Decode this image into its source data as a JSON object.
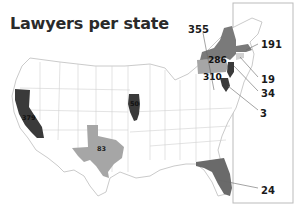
{
  "title": "Lawyers per state",
  "states": [
    {
      "name": "California",
      "value": "379",
      "shade": "#3a3a3a",
      "label_color": "#111111"
    },
    {
      "name": "Illinois",
      "value": "50",
      "shade": "#3a3a3a",
      "label_color": "#111111"
    },
    {
      "name": "Texas",
      "value": "83",
      "shade": "#a6a6a6",
      "label_color": "#222222"
    },
    {
      "name": "New York",
      "value": "286",
      "shade": "#7a7a7a",
      "label_color": "#111111"
    },
    {
      "name": "Pennsylvania",
      "value": "310",
      "shade": "#a6a6a6",
      "label_color": "#111111"
    },
    {
      "name": "Massachusetts",
      "value": "191",
      "shade": "#7a7a7a"
    },
    {
      "name": "Connecticut",
      "value": "19",
      "shade": "#d2d2d2"
    },
    {
      "name": "New Jersey",
      "value": "34",
      "shade": "#3a3a3a"
    },
    {
      "name": "Maryland",
      "value": "3",
      "shade": "#3a3a3a"
    },
    {
      "name": "Florida",
      "value": "24",
      "shade": "#6a6a6a"
    },
    {
      "name": "Ohio",
      "value": "355",
      "shade": "#7a7a7a"
    }
  ],
  "callouts": {
    "ny_top": "355",
    "ny": "286",
    "pa": "310",
    "ma": "191",
    "ct": "19",
    "nj": "34",
    "md": "3",
    "fl": "24",
    "ca": "379",
    "il": "50",
    "tx": "83"
  }
}
